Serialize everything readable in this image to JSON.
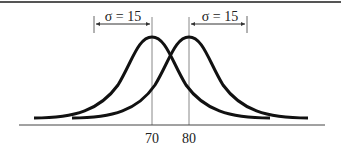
{
  "diagram": {
    "distributions": [
      {
        "name": "left",
        "mean": 70,
        "sigma": 15
      },
      {
        "name": "right",
        "mean": 80,
        "sigma": 15
      }
    ],
    "annotations": {
      "left_sigma": "σ = 15",
      "right_sigma": "σ = 15"
    },
    "axis": {
      "ticks": [
        "70",
        "80"
      ]
    },
    "colors": {
      "curve": "#111111",
      "guide": "#888888",
      "border": "#555555"
    }
  }
}
